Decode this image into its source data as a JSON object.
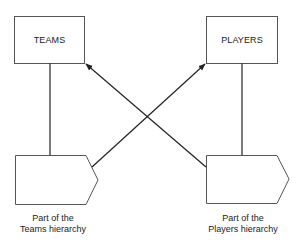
{
  "diagram": {
    "entities": [
      {
        "id": "teams",
        "label": "TEAMS"
      },
      {
        "id": "players",
        "label": "PLAYERS"
      }
    ],
    "hierarchy_parts": [
      {
        "id": "teams-part",
        "caption_line1": "Part of the",
        "caption_line2": "Teams hierarchy"
      },
      {
        "id": "players-part",
        "caption_line1": "Part of the",
        "caption_line2": "Players hierarchy"
      }
    ],
    "connections": [
      {
        "from": "teams",
        "to": "teams-part",
        "type": "line"
      },
      {
        "from": "players",
        "to": "players-part",
        "type": "line"
      },
      {
        "from": "teams-part",
        "to": "players",
        "type": "arrow"
      },
      {
        "from": "players-part",
        "to": "teams",
        "type": "arrow"
      }
    ],
    "colors": {
      "stroke": "#222222",
      "box_stroke": "#555555",
      "background": "#ffffff"
    }
  }
}
